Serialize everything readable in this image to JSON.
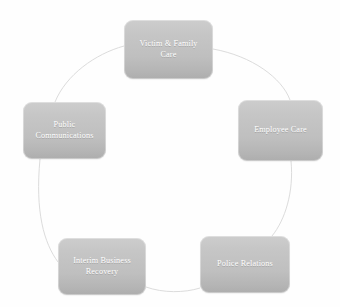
{
  "diagram": {
    "type": "cycle",
    "title": "",
    "center_label": "",
    "background_color": "#fdfdfd",
    "node_fill_top": "#cdcdcd",
    "node_fill_bottom": "#adadad",
    "node_text_color": "#ffffff",
    "connector_color": "#dcdcdc",
    "nodes": [
      {
        "id": "victim",
        "label": "Victim & Family\nCare",
        "position": "top"
      },
      {
        "id": "employee",
        "label": "Employee Care",
        "position": "right"
      },
      {
        "id": "police",
        "label": "Police Relations",
        "position": "bottom-right"
      },
      {
        "id": "interim",
        "label": "Interim Business\nRecovery",
        "position": "bottom-left"
      },
      {
        "id": "public",
        "label": "Public\nCommunications",
        "position": "left"
      }
    ],
    "connectors": [
      {
        "from": "victim",
        "to": "employee"
      },
      {
        "from": "employee",
        "to": "police"
      },
      {
        "from": "police",
        "to": "interim"
      },
      {
        "from": "interim",
        "to": "public"
      },
      {
        "from": "public",
        "to": "victim"
      }
    ]
  },
  "footer": {
    "clipped_caption": "                     "
  }
}
